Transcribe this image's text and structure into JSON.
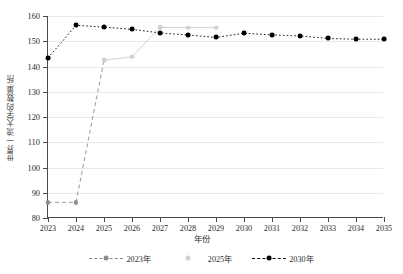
{
  "chart_data": {
    "type": "line",
    "title": "",
    "xlabel": "年份",
    "ylabel": "世界一流大学的数量/所",
    "xlim": [
      2023,
      2035
    ],
    "ylim": [
      80,
      160
    ],
    "ytick_step": 10,
    "grid": true,
    "legend_position": "bottom",
    "x_ticks": [
      "2023",
      "2024",
      "2025",
      "2026",
      "2027",
      "2028",
      "2029",
      "2030",
      "2031",
      "2032",
      "2033",
      "2034",
      "2035"
    ],
    "y_ticks": [
      "80",
      "90",
      "100",
      "110",
      "120",
      "130",
      "140",
      "150",
      "160"
    ],
    "categories": [
      2023,
      2024,
      2025,
      2026,
      2027,
      2028,
      2029,
      2030,
      2031,
      2032,
      2033,
      2034,
      2035
    ],
    "series": [
      {
        "name": "2023年",
        "color": "#8c8c8c",
        "linestyle": "dashed",
        "x": [
          2023,
          2024,
          2025
        ],
        "values": [
          86.2,
          86.2,
          142.5
        ]
      },
      {
        "name": "2025年",
        "color": "#d2d2d2",
        "linestyle": "solid",
        "x": [
          2025,
          2026,
          2027,
          2028,
          2029
        ],
        "values": [
          142.5,
          143.8,
          155.5,
          155.4,
          155.4
        ]
      },
      {
        "name": "2030年",
        "color": "#000000",
        "linestyle": "dotted",
        "x": [
          2023,
          2024,
          2025,
          2026,
          2027,
          2028,
          2029,
          2030,
          2031,
          2032,
          2033,
          2034,
          2035
        ],
        "values": [
          143.4,
          156.3,
          155.6,
          154.7,
          153.3,
          152.5,
          151.5,
          153.2,
          152.5,
          152.1,
          151.1,
          150.8,
          150.8
        ]
      }
    ],
    "legend": [
      {
        "label": "2023年",
        "color": "#8c8c8c",
        "linestyle": "dashed"
      },
      {
        "label": "2025年",
        "color": "#d2d2d2",
        "linestyle": "solid"
      },
      {
        "label": "2030年",
        "color": "#000000",
        "linestyle": "dotted"
      }
    ]
  }
}
